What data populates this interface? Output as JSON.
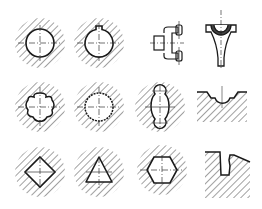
{
  "diagram": {
    "type": "machining-profile-sections",
    "background": "#ffffff",
    "stroke_color": "#1a1a1a",
    "hatch_color": "#444444",
    "rows": [
      {
        "items": [
          {
            "name": "round-hole",
            "shape": "circle"
          },
          {
            "name": "keyed-round-hole",
            "shape": "circle-with-keyway"
          },
          {
            "name": "fork-yoke",
            "shape": "yoke"
          },
          {
            "name": "connecting-rod-end",
            "shape": "rod-half-bearing"
          }
        ]
      },
      {
        "items": [
          {
            "name": "hexalobular-hole",
            "shape": "six-lobe"
          },
          {
            "name": "serrated-spline-hole",
            "shape": "serrated-circle"
          },
          {
            "name": "triple-lobe-slot",
            "shape": "lobed-slot"
          },
          {
            "name": "profiled-groove-surface",
            "shape": "groove"
          }
        ]
      },
      {
        "items": [
          {
            "name": "square-hole",
            "shape": "diamond"
          },
          {
            "name": "triangular-hole",
            "shape": "triangle"
          },
          {
            "name": "hexagonal-hole",
            "shape": "hexagon"
          },
          {
            "name": "dovetail-step-surface",
            "shape": "step-dovetail"
          }
        ]
      }
    ]
  }
}
